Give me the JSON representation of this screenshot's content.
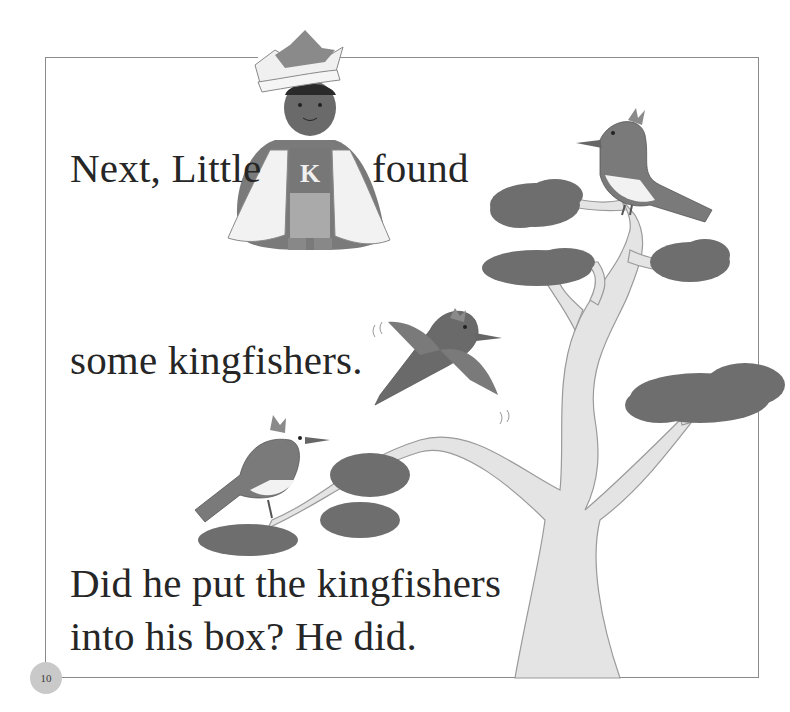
{
  "page": {
    "lines": {
      "line1_part1": "Next, Little",
      "line1_part2": "found",
      "line2": "some kingfishers.",
      "line3": "Did he put the kingfishers",
      "line4": "into his box? He did."
    },
    "page_number": "10"
  },
  "illustration": {
    "character": "king-boy-with-crown-and-cape",
    "shirt_letter": "K",
    "birds": [
      "kingfisher-perched-top",
      "kingfisher-flying",
      "kingfisher-perched-left"
    ],
    "tree": "bonsai-style-tree"
  },
  "colors": {
    "border": "#8a8a8a",
    "text": "#262626",
    "foliage": "#6e6e6e",
    "trunk": "#e4e4e4",
    "page_circle": "#c9c9c9"
  }
}
